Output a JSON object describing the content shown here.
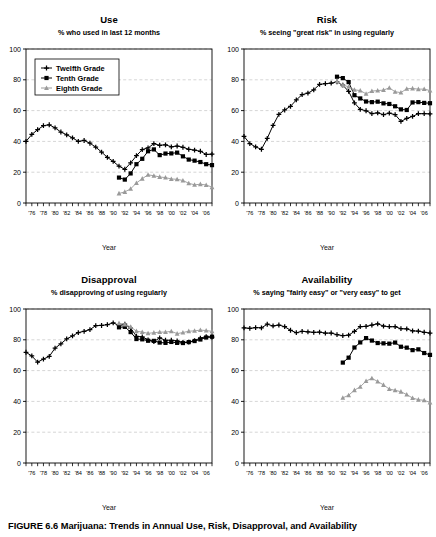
{
  "figure": {
    "caption_label": "FIGURE 6.6",
    "caption_text": "Marijuana: Trends in Annual Use, Risk, Disapproval, and Availability"
  },
  "axes": {
    "y_ticks": [
      0,
      20,
      40,
      60,
      80,
      100
    ],
    "ylim": [
      0,
      100
    ],
    "x_tick_labels": [
      "'76",
      "'78",
      "'80",
      "'82",
      "'84",
      "'86",
      "'88",
      "'90",
      "'92",
      "'94",
      "'96",
      "'98",
      "'00",
      "'02",
      "'04",
      "'06"
    ],
    "xlim": [
      1975,
      2007
    ],
    "x_axis_title": "Year",
    "grid": "horizontal-dashed",
    "legend_position": "top-left of Use panel"
  },
  "legend": {
    "items": [
      {
        "label": "Twelfth Grade",
        "color": "#000000",
        "marker": "plus"
      },
      {
        "label": "Tenth Grade",
        "color": "#000000",
        "marker": "square"
      },
      {
        "label": "Eighth Grade",
        "color": "#9a9a9a",
        "marker": "triangle"
      }
    ]
  },
  "colors": {
    "twelfth": "#000000",
    "tenth": "#000000",
    "eighth": "#9a9a9a",
    "grid": "#b9b9b9",
    "frame": "#000000"
  },
  "chart_data": [
    {
      "type": "line",
      "title": "Use",
      "subtitle": "% who used in last 12 months",
      "xlabel": "Year",
      "ylabel": "",
      "ylim": [
        0,
        100
      ],
      "x": [
        1975,
        1976,
        1977,
        1978,
        1979,
        1980,
        1981,
        1982,
        1983,
        1984,
        1985,
        1986,
        1987,
        1988,
        1989,
        1990,
        1991,
        1992,
        1993,
        1994,
        1995,
        1996,
        1997,
        1998,
        1999,
        2000,
        2001,
        2002,
        2003,
        2004,
        2005,
        2006,
        2007
      ],
      "series": [
        {
          "name": "Twelfth Grade",
          "marker": "plus",
          "color": "#000000",
          "values": [
            40.0,
            44.5,
            47.6,
            50.2,
            50.8,
            48.8,
            46.1,
            44.3,
            42.3,
            40.0,
            40.6,
            38.8,
            36.3,
            33.1,
            29.6,
            27.0,
            23.9,
            21.9,
            26.0,
            30.7,
            34.7,
            35.8,
            38.5,
            37.5,
            37.8,
            36.5,
            37.0,
            36.2,
            34.9,
            34.3,
            33.6,
            31.5,
            31.7
          ]
        },
        {
          "name": "Tenth Grade",
          "marker": "square",
          "color": "#000000",
          "values": [
            null,
            null,
            null,
            null,
            null,
            null,
            null,
            null,
            null,
            null,
            null,
            null,
            null,
            null,
            null,
            null,
            16.5,
            15.2,
            19.2,
            25.2,
            28.7,
            33.6,
            34.8,
            31.1,
            32.1,
            32.2,
            32.7,
            30.3,
            28.2,
            27.5,
            26.6,
            25.2,
            24.6
          ]
        },
        {
          "name": "Eighth Grade",
          "marker": "triangle",
          "color": "#9a9a9a",
          "values": [
            null,
            null,
            null,
            null,
            null,
            null,
            null,
            null,
            null,
            null,
            null,
            null,
            null,
            null,
            null,
            null,
            6.2,
            7.2,
            9.2,
            13.0,
            15.8,
            18.3,
            17.7,
            16.9,
            16.5,
            15.6,
            15.4,
            14.6,
            12.8,
            11.8,
            12.2,
            11.7,
            10.3
          ]
        }
      ]
    },
    {
      "type": "line",
      "title": "Risk",
      "subtitle": "% seeing \"great risk\" in using regularly",
      "xlabel": "Year",
      "ylabel": "",
      "ylim": [
        0,
        100
      ],
      "x": [
        1975,
        1976,
        1977,
        1978,
        1979,
        1980,
        1981,
        1982,
        1983,
        1984,
        1985,
        1986,
        1987,
        1988,
        1989,
        1990,
        1991,
        1992,
        1993,
        1994,
        1995,
        1996,
        1997,
        1998,
        1999,
        2000,
        2001,
        2002,
        2003,
        2004,
        2005,
        2006,
        2007
      ],
      "series": [
        {
          "name": "Twelfth Grade",
          "marker": "plus",
          "color": "#000000",
          "values": [
            43.3,
            38.6,
            36.4,
            34.9,
            42.0,
            50.4,
            57.6,
            60.4,
            62.8,
            66.9,
            70.4,
            71.3,
            73.5,
            77.0,
            77.5,
            77.8,
            78.6,
            76.5,
            72.5,
            65.0,
            60.8,
            59.9,
            58.1,
            58.5,
            57.4,
            58.3,
            57.4,
            53.0,
            54.9,
            56.2,
            58.0,
            58.0,
            57.9
          ]
        },
        {
          "name": "Tenth Grade",
          "marker": "square",
          "color": "#000000",
          "values": [
            null,
            null,
            null,
            null,
            null,
            null,
            null,
            null,
            null,
            null,
            null,
            null,
            null,
            null,
            null,
            null,
            82.0,
            81.1,
            78.5,
            70.0,
            67.9,
            65.9,
            65.5,
            65.8,
            64.7,
            64.3,
            62.8,
            60.8,
            60.4,
            65.3,
            65.5,
            65.0,
            64.8
          ]
        },
        {
          "name": "Eighth Grade",
          "marker": "triangle",
          "color": "#9a9a9a",
          "values": [
            null,
            null,
            null,
            null,
            null,
            null,
            null,
            null,
            null,
            null,
            null,
            null,
            null,
            null,
            null,
            null,
            79.0,
            76.5,
            75.5,
            73.5,
            73.0,
            70.9,
            72.7,
            73.0,
            73.3,
            74.8,
            72.2,
            71.7,
            74.2,
            74.4,
            73.9,
            74.0,
            73.0
          ]
        }
      ]
    },
    {
      "type": "line",
      "title": "Disapproval",
      "subtitle": "% disapproving of using regularly",
      "xlabel": "Year",
      "ylabel": "",
      "ylim": [
        0,
        100
      ],
      "x": [
        1975,
        1976,
        1977,
        1978,
        1979,
        1980,
        1981,
        1982,
        1983,
        1984,
        1985,
        1986,
        1987,
        1988,
        1989,
        1990,
        1991,
        1992,
        1993,
        1994,
        1995,
        1996,
        1997,
        1998,
        1999,
        2000,
        2001,
        2002,
        2003,
        2004,
        2005,
        2006,
        2007
      ],
      "series": [
        {
          "name": "Twelfth Grade",
          "marker": "plus",
          "color": "#000000",
          "values": [
            71.9,
            69.5,
            65.5,
            67.5,
            69.2,
            74.6,
            77.4,
            80.6,
            82.5,
            84.7,
            85.5,
            86.6,
            89.2,
            89.3,
            89.8,
            91.0,
            89.3,
            90.1,
            87.6,
            82.3,
            81.9,
            80.0,
            78.8,
            81.2,
            79.7,
            79.7,
            79.3,
            78.3,
            78.5,
            79.5,
            81.1,
            82.0,
            81.7
          ]
        },
        {
          "name": "Tenth Grade",
          "marker": "square",
          "color": "#000000",
          "values": [
            null,
            null,
            null,
            null,
            null,
            null,
            null,
            null,
            null,
            null,
            null,
            null,
            null,
            null,
            null,
            null,
            88.1,
            88.4,
            85.0,
            80.5,
            80.3,
            79.4,
            79.3,
            78.2,
            78.0,
            78.6,
            78.0,
            77.9,
            78.5,
            79.2,
            80.2,
            81.5,
            82.0
          ]
        },
        {
          "name": "Eighth Grade",
          "marker": "triangle",
          "color": "#9a9a9a",
          "values": [
            null,
            null,
            null,
            null,
            null,
            null,
            null,
            null,
            null,
            null,
            null,
            null,
            null,
            null,
            null,
            null,
            90.8,
            90.0,
            88.4,
            85.6,
            85.0,
            84.2,
            84.6,
            85.0,
            85.0,
            85.5,
            84.0,
            84.7,
            85.6,
            85.8,
            86.3,
            86.0,
            85.5
          ]
        }
      ]
    },
    {
      "type": "line",
      "title": "Availability",
      "subtitle": "% saying \"fairly easy\" or \"very easy\" to get",
      "xlabel": "Year",
      "ylabel": "",
      "ylim": [
        0,
        100
      ],
      "x": [
        1975,
        1976,
        1977,
        1978,
        1979,
        1980,
        1981,
        1982,
        1983,
        1984,
        1985,
        1986,
        1987,
        1988,
        1989,
        1990,
        1991,
        1992,
        1993,
        1994,
        1995,
        1996,
        1997,
        1998,
        1999,
        2000,
        2001,
        2002,
        2003,
        2004,
        2005,
        2006,
        2007
      ],
      "series": [
        {
          "name": "Twelfth Grade",
          "marker": "plus",
          "color": "#000000",
          "values": [
            87.8,
            87.4,
            87.9,
            87.8,
            90.1,
            89.0,
            89.6,
            88.5,
            86.2,
            84.6,
            85.5,
            85.2,
            84.8,
            85.0,
            84.3,
            84.4,
            83.3,
            82.7,
            83.0,
            85.5,
            88.5,
            88.7,
            89.6,
            90.4,
            88.9,
            88.5,
            88.5,
            87.2,
            87.1,
            85.8,
            85.6,
            84.9,
            84.4
          ]
        },
        {
          "name": "Tenth Grade",
          "marker": "square",
          "color": "#000000",
          "values": [
            null,
            null,
            null,
            null,
            null,
            null,
            null,
            null,
            null,
            null,
            null,
            null,
            null,
            null,
            null,
            null,
            null,
            65.2,
            68.4,
            75.0,
            78.3,
            81.1,
            79.5,
            77.9,
            77.7,
            77.5,
            78.2,
            75.5,
            74.9,
            73.3,
            73.8,
            71.4,
            70.2
          ]
        },
        {
          "name": "Eighth Grade",
          "marker": "triangle",
          "color": "#9a9a9a",
          "values": [
            null,
            null,
            null,
            null,
            null,
            null,
            null,
            null,
            null,
            null,
            null,
            null,
            null,
            null,
            null,
            null,
            null,
            42.3,
            44.0,
            47.3,
            49.5,
            53.2,
            55.0,
            52.9,
            50.7,
            48.0,
            47.2,
            46.3,
            44.4,
            42.2,
            41.1,
            40.7,
            39.3
          ]
        }
      ]
    }
  ]
}
